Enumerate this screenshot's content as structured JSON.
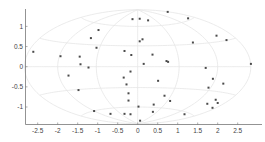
{
  "chart_data": {
    "type": "scatter",
    "title": "",
    "xlabel": "",
    "ylabel": "",
    "projection_grid": "hammer",
    "grid": true,
    "xlim": [
      -2.83,
      2.9
    ],
    "ylim": [
      -1.43,
      1.43
    ],
    "xticks": [
      -2.5,
      -2,
      -1.5,
      -1,
      -0.5,
      0,
      0.5,
      1,
      1.5,
      2,
      2.5
    ],
    "xtick_labels": [
      "-2.5",
      "-2",
      "-1.5",
      "-1",
      "-0.5",
      "0",
      "0.5",
      "1",
      "1.5",
      "2",
      "2.5"
    ],
    "yticks": [
      1,
      0.5,
      0,
      -0.5,
      -1
    ],
    "ytick_labels": [
      "1",
      "0.5",
      "0",
      "-0.5",
      "-1"
    ],
    "colors": {
      "points": "#4a4a4a",
      "grid": "#e6e6e6",
      "axis": "#777777"
    },
    "points": [
      [
        -2.61,
        0.37
      ],
      [
        -1.93,
        0.26
      ],
      [
        -1.73,
        -0.22
      ],
      [
        -1.48,
        -0.58
      ],
      [
        -1.45,
        0.25
      ],
      [
        -1.43,
        0.06
      ],
      [
        -1.23,
        -0.02
      ],
      [
        -1.17,
        0.71
      ],
      [
        -1.03,
        0.47
      ],
      [
        -0.98,
        0.91
      ],
      [
        -1.09,
        -1.1
      ],
      [
        -0.68,
        -1.17
      ],
      [
        -0.33,
        0.39
      ],
      [
        -0.16,
        0.29
      ],
      [
        -0.13,
        1.18
      ],
      [
        0.05,
        1.19
      ],
      [
        0.26,
        1.15
      ],
      [
        0.05,
        0.63
      ],
      [
        0.12,
        0.68
      ],
      [
        0.37,
        0.3
      ],
      [
        0.15,
        0.07
      ],
      [
        0.75,
        1.36
      ],
      [
        0.72,
        0.14
      ],
      [
        0.76,
        0.12
      ],
      [
        -0.18,
        -0.12
      ],
      [
        -0.35,
        -0.27
      ],
      [
        -0.28,
        -0.44
      ],
      [
        -0.23,
        -0.66
      ],
      [
        -0.23,
        -0.84
      ],
      [
        0.51,
        -0.35
      ],
      [
        0.67,
        -0.72
      ],
      [
        0.81,
        -0.85
      ],
      [
        0.02,
        -0.99
      ],
      [
        0.4,
        -0.94
      ],
      [
        0.38,
        -1.12
      ],
      [
        -0.33,
        -1.17
      ],
      [
        -0.18,
        -1.18
      ],
      [
        0.06,
        -1.34
      ],
      [
        1.17,
        -1.18
      ],
      [
        1.26,
        1.2
      ],
      [
        1.38,
        0.6
      ],
      [
        1.97,
        0.77
      ],
      [
        2.22,
        0.66
      ],
      [
        2.83,
        0.07
      ],
      [
        1.7,
        -0.03
      ],
      [
        1.88,
        -0.3
      ],
      [
        2.14,
        -0.42
      ],
      [
        1.77,
        -0.52
      ],
      [
        1.95,
        -0.82
      ],
      [
        1.74,
        -0.92
      ],
      [
        2.0,
        -0.9
      ],
      [
        1.87,
        -1.02
      ]
    ]
  }
}
